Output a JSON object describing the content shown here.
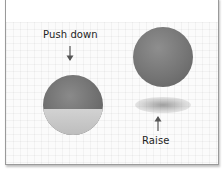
{
  "figure": {
    "left_panel": {
      "label": "Push down",
      "arrow_direction": "down",
      "ball_state": "partially submerged"
    },
    "right_panel": {
      "label": "Raise",
      "arrow_direction": "up",
      "ball_state": "floating above shadow"
    },
    "colors": {
      "ball": "#767676",
      "ball_lower": "#c8c8c8",
      "shadow": "#8a8a8a",
      "border": "#9a9a9a"
    }
  }
}
